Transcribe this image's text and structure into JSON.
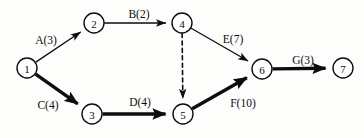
{
  "diagram": {
    "type": "activity-on-arrow-network",
    "canvas": {
      "width": 364,
      "height": 138,
      "background": "#fdfdfc"
    },
    "ink_color": "#0d0d0d",
    "node_radius": 10,
    "nodes": [
      {
        "id": "1",
        "label": "1",
        "x": 27,
        "y": 68
      },
      {
        "id": "2",
        "label": "2",
        "x": 94,
        "y": 23
      },
      {
        "id": "3",
        "label": "3",
        "x": 92,
        "y": 114
      },
      {
        "id": "4",
        "label": "4",
        "x": 182,
        "y": 23
      },
      {
        "id": "5",
        "label": "5",
        "x": 183,
        "y": 114
      },
      {
        "id": "6",
        "label": "6",
        "x": 262,
        "y": 69
      },
      {
        "id": "7",
        "label": "7",
        "x": 343,
        "y": 68
      }
    ],
    "edges": [
      {
        "id": "A",
        "activity": "A",
        "duration": 3,
        "label": "A(3)",
        "from": "1",
        "to": "2",
        "style": "thin",
        "critical": false,
        "label_x": 46,
        "label_y": 44
      },
      {
        "id": "B",
        "activity": "B",
        "duration": 2,
        "label": "B(2)",
        "from": "2",
        "to": "4",
        "style": "thin",
        "critical": false,
        "label_x": 139,
        "label_y": 18
      },
      {
        "id": "C",
        "activity": "C",
        "duration": 4,
        "label": "C(4)",
        "from": "1",
        "to": "3",
        "style": "bold",
        "critical": true,
        "label_x": 48,
        "label_y": 109
      },
      {
        "id": "D",
        "activity": "D",
        "duration": 4,
        "label": "D(4)",
        "from": "3",
        "to": "5",
        "style": "bold",
        "critical": true,
        "label_x": 140,
        "label_y": 106
      },
      {
        "id": "E",
        "activity": "E",
        "duration": 7,
        "label": "E(7)",
        "from": "4",
        "to": "6",
        "style": "thin",
        "critical": false,
        "label_x": 233,
        "label_y": 43
      },
      {
        "id": "F",
        "activity": "F",
        "duration": 10,
        "label": "F(10)",
        "from": "5",
        "to": "6",
        "style": "bold",
        "critical": true,
        "label_x": 243,
        "label_y": 107
      },
      {
        "id": "G",
        "activity": "G",
        "duration": 3,
        "label": "G(3)",
        "from": "6",
        "to": "7",
        "style": "bold",
        "critical": true,
        "label_x": 303,
        "label_y": 64
      },
      {
        "id": "dummy-4-5",
        "activity": "",
        "duration": 0,
        "label": "",
        "from": "4",
        "to": "5",
        "style": "dashed",
        "critical": false,
        "label_x": 0,
        "label_y": 0
      }
    ]
  }
}
